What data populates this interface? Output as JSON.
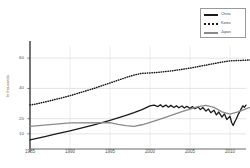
{
  "chart_data": {
    "type": "line",
    "title": "",
    "xlabel": "",
    "ylabel": "In thousands",
    "xlim": [
      1985,
      2012
    ],
    "ylim": [
      0,
      68
    ],
    "grid": true,
    "legend_position": "top-right",
    "xticks": [
      1985,
      1990,
      1995,
      2000,
      2005,
      2010
    ],
    "yticks": [
      10,
      20,
      40,
      60
    ],
    "series": [
      {
        "name": "China",
        "style": "solid",
        "color": "#1a1a1a",
        "points": [
          [
            1985,
            6.0
          ],
          [
            1986,
            7.2
          ],
          [
            1987,
            8.4
          ],
          [
            1988,
            9.6
          ],
          [
            1989,
            10.8
          ],
          [
            1990,
            12.0
          ],
          [
            1991,
            13.3
          ],
          [
            1992,
            14.6
          ],
          [
            1993,
            16.0
          ],
          [
            1994,
            17.4
          ],
          [
            1995,
            18.9
          ],
          [
            1996,
            20.5
          ],
          [
            1997,
            22.2
          ],
          [
            1998,
            24.0
          ],
          [
            1999,
            26.0
          ],
          [
            2000,
            28.5
          ],
          [
            2000.5,
            29.0
          ],
          [
            2001,
            28.0
          ],
          [
            2001.3,
            29.2
          ],
          [
            2001.6,
            27.8
          ],
          [
            2002,
            29.0
          ],
          [
            2002.3,
            27.6
          ],
          [
            2002.6,
            28.8
          ],
          [
            2003,
            27.4
          ],
          [
            2003.3,
            28.6
          ],
          [
            2003.6,
            27.2
          ],
          [
            2004,
            28.4
          ],
          [
            2004.3,
            27.0
          ],
          [
            2004.6,
            28.2
          ],
          [
            2005,
            26.8
          ],
          [
            2005.3,
            28.0
          ],
          [
            2005.6,
            26.6
          ],
          [
            2006,
            27.8
          ],
          [
            2006.3,
            26.0
          ],
          [
            2006.6,
            27.4
          ],
          [
            2007,
            25.0
          ],
          [
            2007.3,
            26.4
          ],
          [
            2007.6,
            24.0
          ],
          [
            2008,
            25.6
          ],
          [
            2008.3,
            22.5
          ],
          [
            2008.6,
            24.4
          ],
          [
            2009,
            21.0
          ],
          [
            2009.3,
            23.2
          ],
          [
            2009.6,
            19.5
          ],
          [
            2010,
            21.6
          ],
          [
            2010.2,
            17.5
          ],
          [
            2010.4,
            15.5
          ],
          [
            2010.6,
            18.0
          ],
          [
            2010.8,
            20.0
          ],
          [
            2011,
            22.5
          ],
          [
            2011.2,
            24.5
          ],
          [
            2011.4,
            26.5
          ],
          [
            2011.6,
            28.5
          ],
          [
            2011.8,
            27.5
          ],
          [
            2012,
            29.0
          ]
        ]
      },
      {
        "name": "Korea",
        "style": "dotted",
        "color": "#1a1a1a",
        "points": [
          [
            1985,
            29.0
          ],
          [
            1986,
            30.0
          ],
          [
            1987,
            31.2
          ],
          [
            1988,
            32.5
          ],
          [
            1989,
            33.8
          ],
          [
            1990,
            35.2
          ],
          [
            1991,
            36.8
          ],
          [
            1992,
            38.4
          ],
          [
            1993,
            40.0
          ],
          [
            1994,
            41.8
          ],
          [
            1995,
            43.6
          ],
          [
            1996,
            45.4
          ],
          [
            1997,
            47.2
          ],
          [
            1998,
            48.8
          ],
          [
            1999,
            50.0
          ],
          [
            2000,
            50.2
          ],
          [
            2001,
            50.6
          ],
          [
            2002,
            51.2
          ],
          [
            2003,
            51.8
          ],
          [
            2004,
            52.6
          ],
          [
            2005,
            53.4
          ],
          [
            2006,
            54.4
          ],
          [
            2007,
            55.4
          ],
          [
            2008,
            56.4
          ],
          [
            2009,
            57.4
          ],
          [
            2010,
            58.2
          ],
          [
            2011,
            58.4
          ],
          [
            2012,
            58.6
          ],
          [
            2013,
            59.0
          ],
          [
            2014,
            60.2
          ],
          [
            2015,
            61.0
          ]
        ]
      },
      {
        "name": "Japan",
        "style": "solid",
        "color": "#8a8a8a",
        "points": [
          [
            1985,
            15.0
          ],
          [
            1990,
            17.2
          ],
          [
            1995,
            17.4
          ],
          [
            1996,
            16.2
          ],
          [
            1997,
            15.4
          ],
          [
            1998,
            15.0
          ],
          [
            1999,
            16.0
          ],
          [
            2000,
            17.5
          ],
          [
            2001,
            19.2
          ],
          [
            2002,
            21.0
          ],
          [
            2003,
            22.8
          ],
          [
            2004,
            24.6
          ],
          [
            2005,
            26.4
          ],
          [
            2006,
            28.0
          ],
          [
            2007,
            28.8
          ],
          [
            2008,
            27.5
          ],
          [
            2009,
            24.5
          ],
          [
            2010,
            23.0
          ],
          [
            2011,
            24.5
          ],
          [
            2012,
            26.5
          ],
          [
            2013,
            28.5
          ],
          [
            2014,
            30.5
          ]
        ]
      }
    ]
  },
  "legend": {
    "items": [
      {
        "label": "China"
      },
      {
        "label": "Korea"
      },
      {
        "label": "Japan"
      }
    ]
  },
  "axes": {
    "ylabel": "In thousands",
    "yticks": [
      "10",
      "20",
      "40",
      "60"
    ],
    "xticks": [
      "1985",
      "1990",
      "1995",
      "2000",
      "2005",
      "2010"
    ]
  }
}
